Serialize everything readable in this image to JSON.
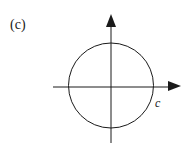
{
  "figure": {
    "panel_label": "(c)",
    "point_label": "c",
    "stroke_color": "#1a1a1a",
    "background": "#ffffff"
  }
}
